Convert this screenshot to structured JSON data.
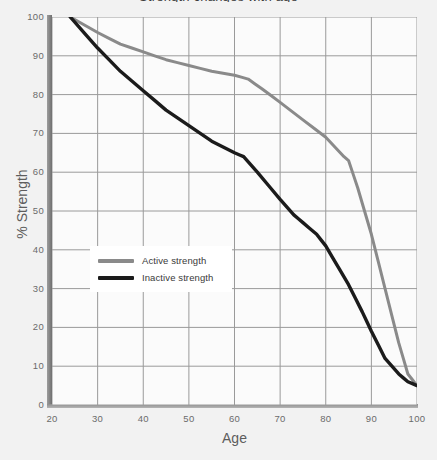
{
  "chart_data": {
    "type": "line",
    "title": "Strength changes with age",
    "xlabel": "Age",
    "ylabel": "% Strength",
    "xlim": [
      20,
      100
    ],
    "ylim": [
      0,
      100
    ],
    "xticks": [
      20,
      30,
      40,
      50,
      60,
      70,
      80,
      90,
      100
    ],
    "yticks": [
      0,
      10,
      20,
      30,
      40,
      50,
      60,
      70,
      80,
      90,
      100
    ],
    "grid": true,
    "legend_position": "center-left",
    "series": [
      {
        "name": "Active strength",
        "color": "#8a8a8a",
        "points": [
          [
            24,
            100
          ],
          [
            30,
            96
          ],
          [
            35,
            93
          ],
          [
            40,
            91
          ],
          [
            45,
            89
          ],
          [
            50,
            87.5
          ],
          [
            55,
            86
          ],
          [
            60,
            85
          ],
          [
            63,
            84
          ],
          [
            66,
            81.5
          ],
          [
            70,
            78
          ],
          [
            75,
            73.5
          ],
          [
            80,
            69
          ],
          [
            84,
            64
          ],
          [
            85,
            63
          ],
          [
            87,
            56
          ],
          [
            90,
            44
          ],
          [
            93,
            30
          ],
          [
            96,
            16
          ],
          [
            98,
            8
          ],
          [
            100,
            5
          ]
        ]
      },
      {
        "name": "Inactive strength",
        "color": "#1b1b1b",
        "points": [
          [
            24,
            100
          ],
          [
            30,
            92
          ],
          [
            35,
            86
          ],
          [
            40,
            81
          ],
          [
            45,
            76
          ],
          [
            50,
            72
          ],
          [
            55,
            68
          ],
          [
            60,
            65
          ],
          [
            62,
            64
          ],
          [
            65,
            60
          ],
          [
            70,
            53
          ],
          [
            73,
            49
          ],
          [
            75,
            47
          ],
          [
            78,
            44
          ],
          [
            80,
            41
          ],
          [
            83,
            35
          ],
          [
            85,
            31
          ],
          [
            88,
            24
          ],
          [
            90,
            19
          ],
          [
            93,
            12
          ],
          [
            96,
            8
          ],
          [
            98,
            6
          ],
          [
            100,
            5
          ]
        ]
      }
    ]
  },
  "axes": {
    "x_label": "Age",
    "y_label": "% Strength",
    "x_ticks": [
      "20",
      "30",
      "40",
      "50",
      "60",
      "70",
      "80",
      "90",
      "100"
    ],
    "y_ticks": [
      "100",
      "90",
      "80",
      "70",
      "60",
      "50",
      "40",
      "30",
      "20",
      "10",
      "0"
    ]
  },
  "legend": {
    "items": [
      {
        "label": "Active strength",
        "color": "#8a8a8a"
      },
      {
        "label": "Inactive strength",
        "color": "#1b1b1b"
      }
    ]
  },
  "colors": {
    "page_background": "#f2f2f2",
    "plot_background": "#fbfbfb",
    "gridline": "#9a9a9a",
    "axis_spine": "#8a8a8a",
    "tick_text": "#6b6b6b",
    "active_series": "#8a8a8a",
    "inactive_series": "#1b1b1b"
  }
}
